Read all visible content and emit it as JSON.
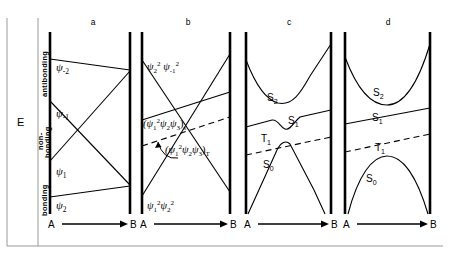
{
  "figure": {
    "type": "energy-correlation-diagram",
    "axes": {
      "y_label": "E",
      "y_zones": [
        {
          "id": "antibonding",
          "label": "antibonding"
        },
        {
          "id": "nonbonding",
          "label": "non-\nbonding"
        },
        {
          "id": "bonding",
          "label": "bonding"
        }
      ],
      "x_start_label": "A",
      "x_end_label": "B",
      "x_axis_style": "arrow"
    },
    "panels": [
      {
        "id": "a",
        "title": "a",
        "kind": "orbital-correlation",
        "bar_left_x": 50,
        "bar_right_x": 130,
        "labels": [
          {
            "text": "ψ",
            "sub": "-2",
            "sup": "",
            "x": 57,
            "y": 68
          },
          {
            "text": "ψ",
            "sub": "-1",
            "sup": "",
            "x": 57,
            "y": 114
          },
          {
            "text": "ψ",
            "sub": "1",
            "sup": "",
            "x": 57,
            "y": 172
          },
          {
            "text": "ψ",
            "sub": "2",
            "sup": "",
            "x": 57,
            "y": 206
          }
        ],
        "lines": [
          {
            "name": "psi-minus-2",
            "from": [
              50,
              59
            ],
            "to": [
              130,
              70
            ]
          },
          {
            "name": "psi-minus-1",
            "from": [
              50,
              101
            ],
            "to": [
              130,
              185
            ]
          },
          {
            "name": "psi-1",
            "from": [
              50,
              161
            ],
            "to": [
              130,
              71
            ]
          },
          {
            "name": "psi-2",
            "from": [
              50,
              197
            ],
            "to": [
              130,
              186
            ]
          }
        ]
      },
      {
        "id": "b",
        "title": "b",
        "kind": "state-correlation",
        "bar_left_x": 142,
        "bar_right_x": 230,
        "labels": [
          {
            "text": "ψ₂² ψ₋₁²",
            "x": 148,
            "y": 66
          },
          {
            "text": "(ψ₁²ψ₂ψ₃)ₛ",
            "x": 145,
            "y": 124
          },
          {
            "text": "(ψ₁²ψ₂ψ₃)ₜ",
            "x": 167,
            "y": 150
          },
          {
            "text": "ψ₁²ψ₂²",
            "x": 148,
            "y": 205
          }
        ],
        "lines": [
          {
            "name": "upper-descending",
            "from": [
              142,
              60
            ],
            "to": [
              230,
              192
            ]
          },
          {
            "name": "lower-ascending",
            "from": [
              142,
              196
            ],
            "to": [
              230,
              54
            ]
          },
          {
            "name": "singlet-solid",
            "from": [
              142,
              120
            ],
            "to": [
              230,
              92
            ]
          },
          {
            "name": "triplet-dashed",
            "from": [
              142,
              146
            ],
            "to": [
              230,
              117
            ],
            "dashed": true
          }
        ]
      },
      {
        "id": "c",
        "title": "c",
        "kind": "state-correlation-avoided",
        "bar_left_x": 246,
        "bar_right_x": 331,
        "labels": [
          {
            "text": "S",
            "sub": "2",
            "x": 272,
            "y": 98
          },
          {
            "text": "S",
            "sub": "1",
            "x": 287,
            "y": 118
          },
          {
            "text": "T",
            "sub": "1",
            "x": 265,
            "y": 135
          },
          {
            "text": "S",
            "sub": "0",
            "x": 268,
            "y": 163
          }
        ]
      },
      {
        "id": "d",
        "title": "d",
        "kind": "state-correlation-separated",
        "bar_left_x": 345,
        "bar_right_x": 430,
        "labels": [
          {
            "text": "S",
            "sub": "2",
            "x": 378,
            "y": 92
          },
          {
            "text": "S",
            "sub": "1",
            "x": 376,
            "y": 116
          },
          {
            "text": "T",
            "sub": "1",
            "x": 379,
            "y": 146
          },
          {
            "text": "S",
            "sub": "0",
            "x": 370,
            "y": 177
          }
        ]
      }
    ],
    "colors": {
      "ink": "#000000",
      "background": "#ffffff",
      "frame": "#9a9a9a"
    }
  }
}
